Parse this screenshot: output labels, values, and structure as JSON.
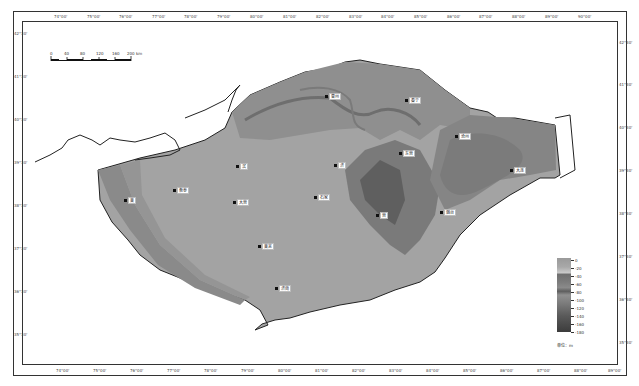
{
  "map": {
    "type": "bathymetric depth map",
    "scale_bar": {
      "ticks": [
        "0",
        "40",
        "80",
        "120",
        "160",
        "200 km"
      ]
    },
    "top_axis_labels": [
      "74°00'",
      "75°00'",
      "76°00'",
      "77°00'",
      "78°00'",
      "79°00'",
      "80°00'",
      "81°00'",
      "82°00'",
      "83°00'",
      "84°00'",
      "85°00'",
      "86°00'",
      "87°00'",
      "88°00'",
      "89°00'",
      "90°00'"
    ],
    "bottom_axis_labels": [
      "74°00'",
      "75°00'",
      "76°00'",
      "77°00'",
      "78°00'",
      "79°00'",
      "80°00'",
      "81°00'",
      "82°00'",
      "83°00'",
      "84°00'",
      "85°00'",
      "86°00'",
      "87°00'",
      "88°00'",
      "89°00'",
      "90°00'"
    ],
    "left_axis_labels": [
      "42°30'",
      "41°30'",
      "40°30'",
      "39°30'",
      "38°30'",
      "37°30'",
      "36°30'",
      "35°30'"
    ],
    "right_axis_labels": [
      "42°30'",
      "41°30'",
      "40°30'",
      "39°30'",
      "38°30'",
      "37°30'",
      "36°30'",
      "35°30'"
    ],
    "legend": {
      "values": [
        "0",
        "-20",
        "-40",
        "-60",
        "-80",
        "-100",
        "-120",
        "-140",
        "-160",
        "-180"
      ],
      "unit": "单位：m",
      "colors": {
        "shallow": "#a8a8a8",
        "deep": "#3c3c3c"
      }
    },
    "stations": [
      {
        "label": "曹州",
        "x": 327,
        "y": 95
      },
      {
        "label": "秦宁",
        "x": 407,
        "y": 99
      },
      {
        "label": "沧州",
        "x": 457,
        "y": 135
      },
      {
        "label": "大连",
        "x": 512,
        "y": 169
      },
      {
        "label": "东营",
        "x": 401,
        "y": 152
      },
      {
        "label": "济",
        "x": 336,
        "y": 164
      },
      {
        "label": "滨",
        "x": 238,
        "y": 165
      },
      {
        "label": "衡泰",
        "x": 175,
        "y": 189
      },
      {
        "label": "莱",
        "x": 126,
        "y": 199
      },
      {
        "label": "石家",
        "x": 316,
        "y": 196
      },
      {
        "label": "大营",
        "x": 235,
        "y": 201
      },
      {
        "label": "营",
        "x": 378,
        "y": 214
      },
      {
        "label": "烟台",
        "x": 442,
        "y": 211
      },
      {
        "label": "莱芜",
        "x": 260,
        "y": 245
      },
      {
        "label": "济南",
        "x": 277,
        "y": 287
      }
    ]
  }
}
